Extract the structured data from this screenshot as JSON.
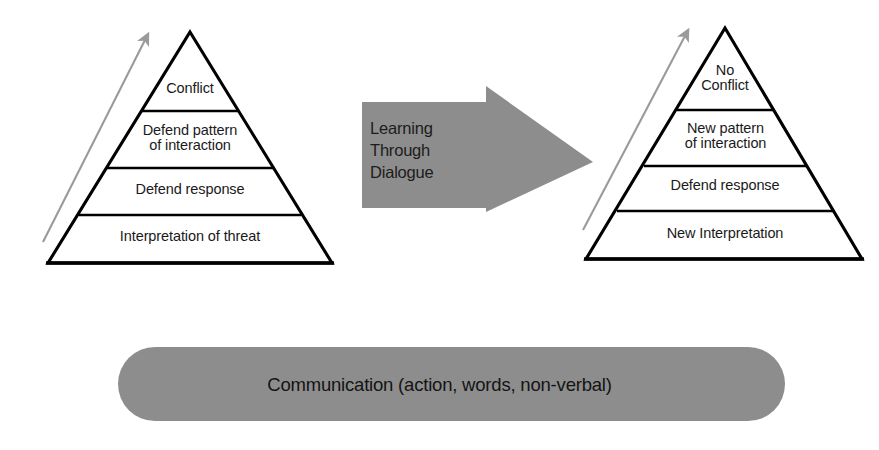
{
  "diagram": {
    "background_color": "#ffffff",
    "ink_color": "#000000",
    "gray_fill": "#8d8d8d",
    "arrow_line_color": "#9a9a9a"
  },
  "left_pyramid": {
    "name": "conflict-pyramid",
    "levels": [
      {
        "id": "conflict",
        "label": "Conflict"
      },
      {
        "id": "defend-pattern",
        "label": "Defend pattern\nof interaction"
      },
      {
        "id": "defend-response",
        "label": "Defend response"
      },
      {
        "id": "interpretation-of-threat",
        "label": "Interpretation of threat"
      }
    ],
    "ascending_arrow_label": ""
  },
  "center_arrow": {
    "name": "learning-through-dialogue-arrow",
    "label": "Learning\nThrough\nDialogue",
    "direction": "right",
    "fill": "#8d8d8d"
  },
  "right_pyramid": {
    "name": "resolution-pyramid",
    "levels": [
      {
        "id": "no-conflict",
        "label": "No\nConflict"
      },
      {
        "id": "new-pattern",
        "label": "New pattern\nof interaction"
      },
      {
        "id": "defend-response",
        "label": "Defend response"
      },
      {
        "id": "new-interpretation",
        "label": "New Interpretation"
      }
    ],
    "ascending_arrow_label": ""
  },
  "bottom_bar": {
    "name": "communication-bar",
    "label": "Communication (action, words, non-verbal)",
    "fill": "#8d8d8d"
  }
}
